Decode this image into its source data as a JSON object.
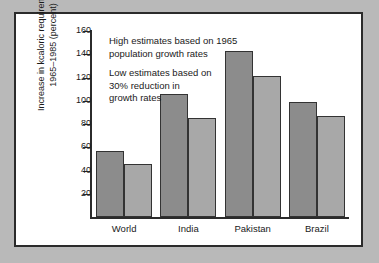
{
  "figure": {
    "background_color": "#ffffff",
    "page_background_color": "#b9b9b9",
    "border_color": "#2b2b2b"
  },
  "annotations": {
    "high_estimate": {
      "line1": "High estimates based on 1965",
      "line2": "population growth rates"
    },
    "low_estimate": {
      "line1": "Low estimates based on",
      "line2": "30% reduction in",
      "line3": "growth rates"
    }
  },
  "axis": {
    "y_title_line1": "Increase in kcaloric requirements",
    "y_title_line2": "1965–1985 (percent)"
  },
  "chart_data": {
    "type": "bar",
    "title": "",
    "xlabel": "",
    "ylabel": "Increase in kcaloric requirements 1965–1985 (percent)",
    "categories": [
      "World",
      "India",
      "Pakistan",
      "Brazil"
    ],
    "series": [
      {
        "name": "High estimates based on 1965 population growth rates",
        "color": "#8c8c8c",
        "values": [
          57,
          106,
          143,
          99
        ]
      },
      {
        "name": "Low estimates based on 30% reduction in growth rates",
        "color": "#a8a8a8",
        "values": [
          46,
          85,
          121,
          87
        ]
      }
    ],
    "ylim": [
      0,
      160
    ],
    "yticks": [
      20,
      40,
      60,
      80,
      100,
      120,
      140,
      160
    ],
    "ytick_labels": [
      "20",
      "40",
      "60",
      "80",
      "100",
      "120",
      "140",
      "160"
    ],
    "grid": false,
    "legend": "none (inline annotations)"
  }
}
